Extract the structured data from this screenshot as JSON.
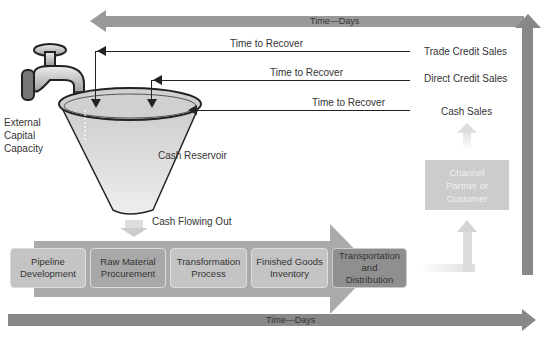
{
  "timeline": {
    "top_label": "Time—Days",
    "bottom_label": "Time—Days"
  },
  "recovery": {
    "label": "Time to Recover",
    "sales": [
      {
        "type": "Trade Credit Sales",
        "recover_label": "Time to Recover"
      },
      {
        "type": "Direct Credit Sales",
        "recover_label": "Time to Recover"
      },
      {
        "type": "Cash Sales",
        "recover_label": "Time to Recover"
      }
    ]
  },
  "faucet": {
    "icon": "faucet-icon",
    "label_lines": [
      "External",
      "Capital",
      "Capacity"
    ]
  },
  "reservoir": {
    "label": "Cash Reservoir"
  },
  "outflow": {
    "label": "Cash Flowing Out"
  },
  "process_steps": [
    {
      "label": "Pipeline Development",
      "lines": [
        "Pipeline",
        "Development"
      ],
      "color": "#c4c4c4"
    },
    {
      "label": "Raw Material Procurement",
      "lines": [
        "Raw Material",
        "Procurement"
      ],
      "color": "#a8a8a8"
    },
    {
      "label": "Transformation Process",
      "lines": [
        "Transformation",
        "Process"
      ],
      "color": "#c4c4c4"
    },
    {
      "label": "Finished Goods Inventory",
      "lines": [
        "Finished Goods",
        "Inventory"
      ],
      "color": "#c4c4c4"
    },
    {
      "label": "Transportation and Distribution",
      "lines": [
        "Transportation",
        "and",
        "Distribution"
      ],
      "color": "#8f8f8f"
    }
  ],
  "channel": {
    "lines": [
      "Channel",
      "Partner or",
      "Customer"
    ]
  },
  "colors": {
    "timeline": "#999999",
    "process_band": "#aaaaaa",
    "channel_box": "#cccccc",
    "reservoir_fill": "#d8d8d8"
  }
}
